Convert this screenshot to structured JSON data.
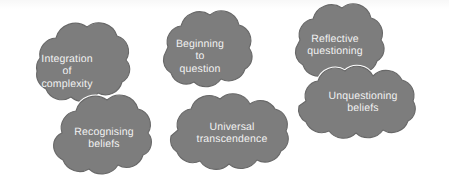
{
  "diagram": {
    "background_color": "#ffffff",
    "cloud_fill_color": "#7d7d7d",
    "cloud_outline_color": "#686868",
    "label_text_color": "#f2f2f2",
    "clouds": [
      {
        "id": "integration-of-complexity",
        "label": "Integration\nof\ncomplexity",
        "lines": [
          "Integration",
          "of",
          "complexity"
        ]
      },
      {
        "id": "beginning-to-question",
        "label": "Beginning\nto\nquestion",
        "lines": [
          "Beginning",
          "to",
          "question"
        ]
      },
      {
        "id": "reflective-questioning",
        "label": "Reflective\nquestioning",
        "lines": [
          "Reflective",
          "questioning"
        ]
      },
      {
        "id": "unquestioning-beliefs",
        "label": "Unquestioning\nbeliefs",
        "lines": [
          "Unquestioning",
          "beliefs"
        ]
      },
      {
        "id": "recognising-beliefs",
        "label": "Recognising\nbeliefs",
        "lines": [
          "Recognising",
          "beliefs"
        ]
      },
      {
        "id": "universal-transcendence",
        "label": "Universal\ntranscendence",
        "lines": [
          "Universal",
          "transcendence"
        ]
      }
    ]
  }
}
